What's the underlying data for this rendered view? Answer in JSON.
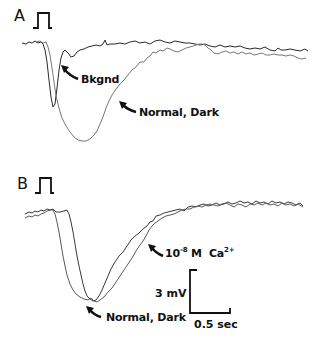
{
  "figure": {
    "panels": [
      {
        "letter": "A",
        "stimulus_icon": "square-pulse-icon",
        "traces": [
          {
            "name": "Bkgnd",
            "label": "Bkgnd",
            "color": "#2a2a2a"
          },
          {
            "name": "Normal, Dark",
            "label": "Normal, Dark",
            "color": "#6a6a6a"
          }
        ]
      },
      {
        "letter": "B",
        "stimulus_icon": "square-pulse-icon",
        "traces": [
          {
            "name": "10^-8 M Ca2+",
            "label_base": "10",
            "label_exp": "-8",
            "label_mid": " M  Ca",
            "label_exp2": "2+",
            "color": "#3a3a3a"
          },
          {
            "name": "Normal, Dark",
            "label": "Normal, Dark",
            "color": "#5a5a5a"
          }
        ]
      }
    ],
    "scale_bar": {
      "voltage": "3 mV",
      "time": "0.5 sec"
    }
  }
}
